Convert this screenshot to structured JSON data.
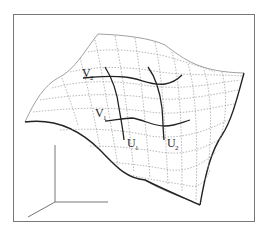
{
  "figure": {
    "labels": {
      "v2": {
        "main": "V",
        "sub": "2"
      },
      "v1": {
        "main": "V",
        "sub": "1"
      },
      "u1": {
        "main": "U",
        "sub": "1"
      },
      "u2": {
        "main": "U",
        "sub": "2"
      }
    },
    "colors": {
      "background": "#ffffff",
      "frame": "#777777",
      "curves": "#222222",
      "grid": "#9a9a9a"
    },
    "elements": [
      "frame",
      "surface-patch",
      "iso-grid",
      "curve-v1",
      "curve-v2",
      "curve-u1",
      "curve-u2",
      "coordinate-axes"
    ]
  }
}
